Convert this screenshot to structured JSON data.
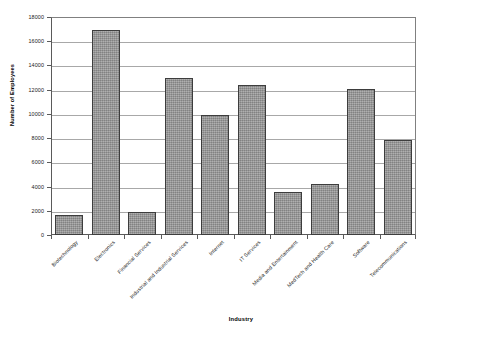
{
  "chart_data": {
    "type": "bar",
    "title": "",
    "xlabel": "Industry",
    "ylabel": "Number of Employees",
    "categories": [
      "Biotechnology",
      "Electronics",
      "Financial Services",
      "Industrial and Industrial Services",
      "Internet",
      "IT Services",
      "Media and Entertainment",
      "MedTech and Health Care",
      "Software",
      "Telecommunications"
    ],
    "values": [
      1650,
      16900,
      1900,
      12950,
      9900,
      12400,
      3550,
      4200,
      12050,
      7850
    ],
    "ylim": [
      0,
      18000
    ],
    "ytick_labels": [
      "0",
      "2000",
      "4000",
      "6000",
      "8000",
      "10000",
      "12000",
      "14000",
      "16000",
      "18000"
    ],
    "ytick_values": [
      0,
      2000,
      4000,
      6000,
      8000,
      10000,
      12000,
      14000,
      16000,
      18000
    ],
    "grid": true,
    "legend": false,
    "bar_color": "#9b9b9b",
    "bar_edge_color": "#3d3d3d",
    "grid_color": "#a8a8a8",
    "axis_color": "#5a5a5a",
    "background": "#ffffff"
  }
}
